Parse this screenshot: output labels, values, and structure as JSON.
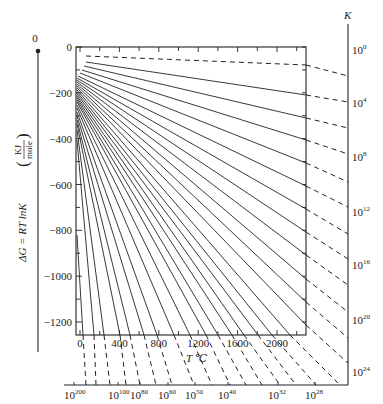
{
  "chart_data": {
    "type": "line",
    "title": "",
    "ylabel": "ΔG = RT lnK (KJ/mole)",
    "xlabel": "T ℃",
    "right_axis_label": "K",
    "ylim": [
      -1260,
      0
    ],
    "xlim": [
      0,
      2300
    ],
    "grid": false,
    "y_ticks": [
      0,
      -200,
      -400,
      -600,
      -800,
      -1000,
      -1200
    ],
    "x_ticks": [
      0,
      400,
      800,
      1200,
      1600,
      2000
    ],
    "right_k_ticks": [
      "10^0",
      "10^4",
      "10^8",
      "10^12",
      "10^16",
      "10^20",
      "10^24"
    ],
    "bottom_k_ticks": [
      "10^200",
      "10^100",
      "10^80",
      "10^60",
      "10^50",
      "10^40",
      "10^32",
      "10^28"
    ],
    "left_scale_zero_label": "0",
    "lines": [
      {
        "x1": 86,
        "y1": 56,
        "x2": 306,
        "y2": 65,
        "style": "dashed"
      },
      {
        "x1": 86,
        "y1": 62,
        "x2": 306,
        "y2": 95,
        "style": "solid"
      },
      {
        "x1": 84,
        "y1": 66,
        "x2": 306,
        "y2": 118,
        "style": "solid"
      },
      {
        "x1": 82,
        "y1": 70,
        "x2": 306,
        "y2": 140,
        "style": "solid"
      },
      {
        "x1": 80,
        "y1": 73,
        "x2": 306,
        "y2": 163,
        "style": "solid"
      },
      {
        "x1": 78,
        "y1": 76,
        "x2": 306,
        "y2": 186,
        "style": "solid"
      },
      {
        "x1": 77,
        "y1": 78,
        "x2": 306,
        "y2": 209,
        "style": "solid"
      },
      {
        "x1": 77,
        "y1": 80,
        "x2": 306,
        "y2": 232,
        "style": "solid"
      },
      {
        "x1": 77,
        "y1": 82,
        "x2": 306,
        "y2": 255,
        "style": "solid"
      },
      {
        "x1": 77,
        "y1": 84,
        "x2": 306,
        "y2": 279,
        "style": "solid"
      },
      {
        "x1": 77,
        "y1": 86,
        "x2": 306,
        "y2": 302,
        "style": "solid"
      },
      {
        "x1": 77,
        "y1": 88,
        "x2": 306,
        "y2": 325,
        "style": "solid"
      },
      {
        "x1": 77,
        "y1": 90,
        "x2": 290,
        "y2": 335,
        "style": "solid"
      },
      {
        "x1": 77,
        "y1": 92,
        "x2": 272,
        "y2": 335,
        "style": "solid"
      },
      {
        "x1": 77,
        "y1": 94,
        "x2": 258,
        "y2": 335,
        "style": "solid"
      },
      {
        "x1": 77,
        "y1": 96,
        "x2": 244,
        "y2": 335,
        "style": "solid"
      },
      {
        "x1": 77,
        "y1": 98,
        "x2": 232,
        "y2": 335,
        "style": "solid"
      },
      {
        "x1": 77,
        "y1": 100,
        "x2": 218,
        "y2": 335,
        "style": "solid"
      },
      {
        "x1": 77,
        "y1": 102,
        "x2": 206,
        "y2": 335,
        "style": "solid"
      },
      {
        "x1": 77,
        "y1": 105,
        "x2": 190,
        "y2": 335,
        "style": "solid"
      },
      {
        "x1": 77,
        "y1": 108,
        "x2": 174,
        "y2": 335,
        "style": "solid"
      },
      {
        "x1": 77,
        "y1": 112,
        "x2": 157,
        "y2": 335,
        "style": "solid"
      },
      {
        "x1": 77,
        "y1": 116,
        "x2": 144,
        "y2": 335,
        "style": "solid"
      },
      {
        "x1": 77,
        "y1": 120,
        "x2": 130,
        "y2": 335,
        "style": "solid"
      },
      {
        "x1": 77,
        "y1": 124,
        "x2": 120,
        "y2": 335,
        "style": "solid"
      },
      {
        "x1": 77,
        "y1": 130,
        "x2": 104,
        "y2": 335,
        "style": "solid"
      },
      {
        "x1": 77,
        "y1": 140,
        "x2": 94,
        "y2": 335,
        "style": "solid"
      },
      {
        "x1": 77,
        "y1": 235,
        "x2": 83,
        "y2": 335,
        "style": "solid"
      }
    ],
    "right_dashed": [
      {
        "x1": 306,
        "y1": 65,
        "x2": 348,
        "y2": 76
      },
      {
        "x1": 306,
        "y1": 95,
        "x2": 348,
        "y2": 102
      },
      {
        "x1": 306,
        "y1": 118,
        "x2": 348,
        "y2": 128
      },
      {
        "x1": 306,
        "y1": 140,
        "x2": 348,
        "y2": 154
      },
      {
        "x1": 306,
        "y1": 163,
        "x2": 348,
        "y2": 182
      },
      {
        "x1": 306,
        "y1": 186,
        "x2": 348,
        "y2": 207
      },
      {
        "x1": 306,
        "y1": 209,
        "x2": 348,
        "y2": 234
      },
      {
        "x1": 306,
        "y1": 232,
        "x2": 348,
        "y2": 259
      },
      {
        "x1": 306,
        "y1": 255,
        "x2": 348,
        "y2": 285
      },
      {
        "x1": 306,
        "y1": 279,
        "x2": 348,
        "y2": 312
      },
      {
        "x1": 306,
        "y1": 302,
        "x2": 348,
        "y2": 338
      },
      {
        "x1": 306,
        "y1": 325,
        "x2": 348,
        "y2": 363
      },
      {
        "x1": 290,
        "y1": 335,
        "x2": 340,
        "y2": 385
      },
      {
        "x1": 272,
        "y1": 335,
        "x2": 316,
        "y2": 385
      },
      {
        "x1": 258,
        "y1": 335,
        "x2": 296,
        "y2": 385
      },
      {
        "x1": 244,
        "y1": 335,
        "x2": 280,
        "y2": 385
      },
      {
        "x1": 232,
        "y1": 335,
        "x2": 262,
        "y2": 385
      },
      {
        "x1": 218,
        "y1": 335,
        "x2": 246,
        "y2": 385
      },
      {
        "x1": 206,
        "y1": 335,
        "x2": 230,
        "y2": 385
      },
      {
        "x1": 190,
        "y1": 335,
        "x2": 212,
        "y2": 385
      },
      {
        "x1": 174,
        "y1": 335,
        "x2": 194,
        "y2": 385
      },
      {
        "x1": 157,
        "y1": 335,
        "x2": 172,
        "y2": 385
      },
      {
        "x1": 144,
        "y1": 335,
        "x2": 156,
        "y2": 385
      },
      {
        "x1": 130,
        "y1": 335,
        "x2": 140,
        "y2": 385
      },
      {
        "x1": 120,
        "y1": 335,
        "x2": 126,
        "y2": 385
      },
      {
        "x1": 104,
        "y1": 335,
        "x2": 110,
        "y2": 385
      },
      {
        "x1": 94,
        "y1": 335,
        "x2": 96,
        "y2": 385
      },
      {
        "x1": 83,
        "y1": 335,
        "x2": 86,
        "y2": 385
      }
    ]
  },
  "labels": {
    "zero_top": "0",
    "k_axis": "K",
    "t_axis": "T ℃",
    "dg_prefix": "ΔG = RT lnK",
    "kj": "KJ",
    "mole": "mole"
  },
  "y_tick_labels": [
    "0",
    "−200",
    "−400",
    "−600",
    "−800",
    "−1000",
    "−1200"
  ],
  "x_tick_labels": [
    "0",
    "400",
    "800",
    "1200",
    "1600",
    "2000"
  ],
  "right_k": [
    {
      "base": "10",
      "exp": "0"
    },
    {
      "base": "10",
      "exp": "4"
    },
    {
      "base": "10",
      "exp": "8"
    },
    {
      "base": "10",
      "exp": "12"
    },
    {
      "base": "10",
      "exp": "16"
    },
    {
      "base": "10",
      "exp": "20"
    },
    {
      "base": "10",
      "exp": "24"
    }
  ],
  "bottom_k": [
    {
      "base": "10",
      "exp": "200"
    },
    {
      "base": "10",
      "exp": "100"
    },
    {
      "base": "10",
      "exp": "80"
    },
    {
      "base": "10",
      "exp": "60"
    },
    {
      "base": "10",
      "exp": "50"
    },
    {
      "base": "10",
      "exp": "40"
    },
    {
      "base": "10",
      "exp": "32"
    },
    {
      "base": "10",
      "exp": "28"
    }
  ]
}
